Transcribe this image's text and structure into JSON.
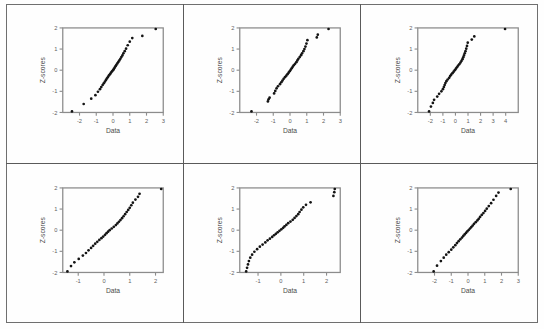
{
  "figure": {
    "type": "multi-panel-figure",
    "panel_rows": 2,
    "panel_cols": 3,
    "background_color": "#fefefe",
    "border_color": "#6f6f6f",
    "point_color": "#141414",
    "axis_color": "#8c8c8c"
  },
  "chart_data": [
    {
      "id": "plot-1",
      "type": "scatter",
      "title": "",
      "xlabel": "Data",
      "ylabel": "Z-scores",
      "xlim": [
        -3,
        3
      ],
      "ylim": [
        -2,
        2
      ],
      "xticks": [
        -2,
        -1,
        0,
        1,
        2,
        3
      ],
      "xticklabels": [
        "-2",
        "-1",
        "0",
        "1",
        "2",
        "3"
      ],
      "yticks": [
        -2,
        -1,
        0,
        1,
        2
      ],
      "yticklabels": [
        "-2",
        "-1",
        "0",
        "1",
        "2"
      ],
      "grid": false,
      "legend": "none",
      "x": [
        -2.45,
        -1.75,
        -1.3,
        -1.05,
        -0.9,
        -0.78,
        -0.7,
        -0.62,
        -0.55,
        -0.48,
        -0.42,
        -0.36,
        -0.3,
        -0.24,
        -0.18,
        -0.12,
        -0.06,
        0.0,
        0.05,
        0.1,
        0.15,
        0.2,
        0.26,
        0.32,
        0.38,
        0.44,
        0.5,
        0.56,
        0.62,
        0.7,
        0.78,
        0.88,
        1.0,
        1.15,
        1.75,
        2.55
      ],
      "y": [
        -1.95,
        -1.6,
        -1.35,
        -1.18,
        -1.02,
        -0.9,
        -0.8,
        -0.7,
        -0.62,
        -0.54,
        -0.46,
        -0.39,
        -0.32,
        -0.25,
        -0.19,
        -0.12,
        -0.06,
        0.0,
        0.06,
        0.12,
        0.19,
        0.25,
        0.32,
        0.39,
        0.46,
        0.54,
        0.62,
        0.7,
        0.8,
        0.9,
        1.02,
        1.18,
        1.35,
        1.52,
        1.62,
        1.95
      ]
    },
    {
      "id": "plot-2",
      "type": "scatter",
      "title": "",
      "xlabel": "Data",
      "ylabel": "Z-scores",
      "xlim": [
        -3,
        3
      ],
      "ylim": [
        -2,
        2
      ],
      "xticks": [
        -2,
        -1,
        0,
        1,
        2,
        3
      ],
      "xticklabels": [
        "-2",
        "-1",
        "0",
        "1",
        "2",
        "3"
      ],
      "yticks": [
        -2,
        -1,
        0,
        1,
        2
      ],
      "yticklabels": [
        "-2",
        "-1",
        "0",
        "1",
        "2"
      ],
      "grid": false,
      "legend": "none",
      "x": [
        -2.3,
        -1.32,
        -1.28,
        -1.22,
        -0.95,
        -0.88,
        -0.8,
        -0.72,
        -0.6,
        -0.52,
        -0.45,
        -0.38,
        -0.3,
        -0.22,
        -0.15,
        -0.08,
        -0.02,
        0.04,
        0.1,
        0.16,
        0.22,
        0.3,
        0.38,
        0.44,
        0.5,
        0.58,
        0.66,
        0.72,
        0.8,
        0.86,
        0.92,
        0.98,
        1.04,
        1.6,
        1.66,
        2.3
      ],
      "y": [
        -1.95,
        -1.48,
        -1.38,
        -1.3,
        -1.1,
        -0.98,
        -0.86,
        -0.76,
        -0.66,
        -0.57,
        -0.49,
        -0.41,
        -0.33,
        -0.26,
        -0.19,
        -0.12,
        -0.05,
        0.02,
        0.09,
        0.16,
        0.23,
        0.3,
        0.38,
        0.46,
        0.54,
        0.62,
        0.71,
        0.8,
        0.9,
        1.0,
        1.12,
        1.26,
        1.42,
        1.55,
        1.68,
        1.95
      ]
    },
    {
      "id": "plot-3",
      "type": "scatter",
      "title": "",
      "xlabel": "Data",
      "ylabel": "Z-scores",
      "xlim": [
        -3,
        5
      ],
      "ylim": [
        -2,
        2
      ],
      "xticks": [
        -2,
        -1,
        0,
        1,
        2,
        3,
        4
      ],
      "xticklabels": [
        "-2",
        "-1",
        "0",
        "1",
        "2",
        "3",
        "4"
      ],
      "yticks": [
        -2,
        -1,
        0,
        1,
        2
      ],
      "yticklabels": [
        "-2",
        "-1",
        "0",
        "1",
        "2"
      ],
      "grid": false,
      "legend": "none",
      "x": [
        -2.1,
        -1.95,
        -1.8,
        -1.7,
        -1.45,
        -1.3,
        -1.12,
        -1.0,
        -0.92,
        -0.86,
        -0.8,
        -0.72,
        -0.62,
        -0.5,
        -0.42,
        -0.34,
        -0.24,
        -0.14,
        -0.05,
        0.04,
        0.12,
        0.2,
        0.3,
        0.4,
        0.48,
        0.56,
        0.62,
        0.68,
        0.74,
        0.8,
        0.86,
        0.92,
        0.98,
        1.3,
        1.5,
        3.95
      ],
      "y": [
        -1.95,
        -1.72,
        -1.55,
        -1.4,
        -1.25,
        -1.12,
        -1.0,
        -0.9,
        -0.8,
        -0.7,
        -0.61,
        -0.52,
        -0.44,
        -0.36,
        -0.28,
        -0.21,
        -0.14,
        -0.07,
        0.0,
        0.07,
        0.14,
        0.21,
        0.28,
        0.36,
        0.44,
        0.52,
        0.61,
        0.7,
        0.8,
        0.9,
        1.02,
        1.15,
        1.3,
        1.45,
        1.6,
        1.95
      ]
    },
    {
      "id": "plot-4",
      "type": "scatter",
      "title": "",
      "xlabel": "Data",
      "ylabel": "Z-scores",
      "xlim": [
        -1.6,
        2.3
      ],
      "ylim": [
        -2,
        2
      ],
      "xticks": [
        -1,
        0,
        1,
        2
      ],
      "xticklabels": [
        "-1",
        "0",
        "1",
        "2"
      ],
      "yticks": [
        -2,
        -1,
        0,
        1,
        2
      ],
      "yticklabels": [
        "-2",
        "-1",
        "0",
        "1",
        "2"
      ],
      "grid": false,
      "legend": "none",
      "x": [
        -1.42,
        -1.28,
        -1.15,
        -0.98,
        -0.82,
        -0.7,
        -0.6,
        -0.5,
        -0.42,
        -0.34,
        -0.26,
        -0.18,
        -0.1,
        -0.03,
        0.04,
        0.1,
        0.16,
        0.22,
        0.3,
        0.38,
        0.46,
        0.52,
        0.58,
        0.64,
        0.7,
        0.76,
        0.82,
        0.88,
        0.94,
        1.0,
        1.06,
        1.12,
        1.22,
        1.32,
        1.38,
        2.22
      ],
      "y": [
        -1.95,
        -1.7,
        -1.52,
        -1.36,
        -1.2,
        -1.08,
        -0.95,
        -0.84,
        -0.74,
        -0.64,
        -0.55,
        -0.46,
        -0.38,
        -0.3,
        -0.22,
        -0.14,
        -0.07,
        0.0,
        0.08,
        0.16,
        0.24,
        0.32,
        0.4,
        0.48,
        0.57,
        0.66,
        0.76,
        0.86,
        0.96,
        1.06,
        1.18,
        1.3,
        1.45,
        1.58,
        1.72,
        1.95
      ]
    },
    {
      "id": "plot-5",
      "type": "scatter",
      "title": "",
      "xlabel": "Data",
      "ylabel": "Z-scores",
      "xlim": [
        -1.8,
        2.6
      ],
      "ylim": [
        -2,
        2
      ],
      "xticks": [
        -1,
        0,
        1,
        2
      ],
      "xticklabels": [
        "-1",
        "0",
        "1",
        "2"
      ],
      "yticks": [
        -2,
        -1,
        0,
        1,
        2
      ],
      "yticklabels": [
        "-2",
        "-1",
        "0",
        "1",
        "2"
      ],
      "grid": false,
      "legend": "none",
      "x": [
        -1.52,
        -1.48,
        -1.44,
        -1.4,
        -1.34,
        -1.26,
        -1.16,
        -1.04,
        -0.92,
        -0.8,
        -0.68,
        -0.58,
        -0.48,
        -0.38,
        -0.3,
        -0.22,
        -0.14,
        -0.06,
        0.02,
        0.1,
        0.16,
        0.24,
        0.32,
        0.42,
        0.52,
        0.6,
        0.68,
        0.76,
        0.82,
        0.9,
        0.98,
        1.1,
        1.3,
        2.3,
        2.34,
        2.36
      ],
      "y": [
        -1.95,
        -1.78,
        -1.62,
        -1.46,
        -1.3,
        -1.16,
        -1.02,
        -0.9,
        -0.78,
        -0.68,
        -0.58,
        -0.48,
        -0.4,
        -0.32,
        -0.24,
        -0.17,
        -0.1,
        -0.03,
        0.04,
        0.11,
        0.18,
        0.25,
        0.33,
        0.41,
        0.49,
        0.58,
        0.67,
        0.76,
        0.86,
        0.97,
        1.08,
        1.2,
        1.32,
        1.62,
        1.8,
        1.95
      ]
    },
    {
      "id": "plot-6",
      "type": "scatter",
      "title": "",
      "xlabel": "Data",
      "ylabel": "Z-scores",
      "xlim": [
        -3,
        3
      ],
      "ylim": [
        -2,
        2
      ],
      "xticks": [
        -2,
        -1,
        0,
        1,
        2,
        3
      ],
      "xticklabels": [
        "-2",
        "-1",
        "0",
        "1",
        "2",
        "3"
      ],
      "yticks": [
        -2,
        -1,
        0,
        1,
        2
      ],
      "yticklabels": [
        "-2",
        "-1",
        "0",
        "1",
        "2"
      ],
      "grid": false,
      "legend": "none",
      "x": [
        -2.05,
        -1.85,
        -1.62,
        -1.45,
        -1.3,
        -1.15,
        -1.0,
        -0.88,
        -0.76,
        -0.66,
        -0.56,
        -0.46,
        -0.36,
        -0.28,
        -0.2,
        -0.12,
        -0.04,
        0.04,
        0.12,
        0.2,
        0.28,
        0.36,
        0.46,
        0.56,
        0.64,
        0.72,
        0.82,
        0.92,
        1.02,
        1.12,
        1.24,
        1.38,
        1.52,
        1.68,
        1.82,
        2.55
      ],
      "y": [
        -1.95,
        -1.68,
        -1.46,
        -1.3,
        -1.16,
        -1.04,
        -0.92,
        -0.81,
        -0.71,
        -0.61,
        -0.52,
        -0.43,
        -0.35,
        -0.27,
        -0.2,
        -0.13,
        -0.06,
        0.01,
        0.08,
        0.15,
        0.22,
        0.3,
        0.38,
        0.46,
        0.54,
        0.63,
        0.72,
        0.81,
        0.91,
        1.02,
        1.14,
        1.28,
        1.44,
        1.62,
        1.78,
        1.95
      ]
    }
  ]
}
